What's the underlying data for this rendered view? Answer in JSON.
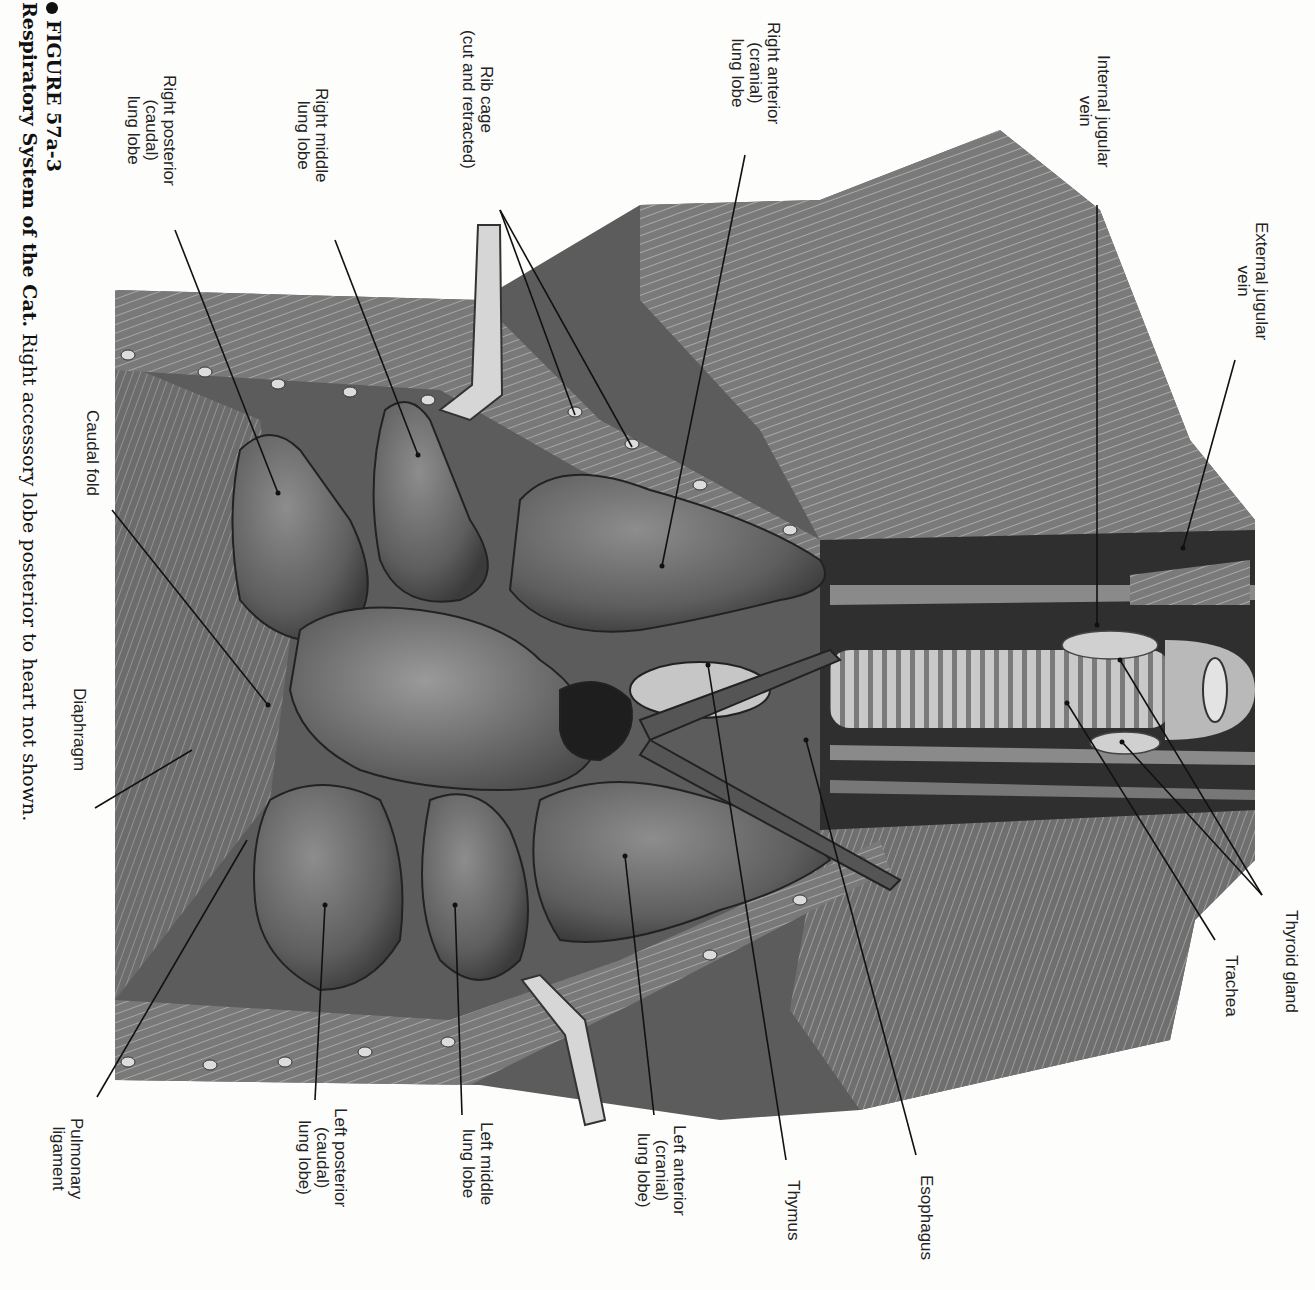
{
  "figure": {
    "number": "FIGURE 57a-3",
    "title": "Respiratory System of the Cat.",
    "caption_text": "Right accessory lobe posterior to heart not shown."
  },
  "labels": {
    "external_jugular_vein": "External jugular\nvein",
    "internal_jugular_vein": "Internal jugular\nvein",
    "right_anterior_lung_lobe": "Right anterior\n(cranial)\nlung lobe",
    "rib_cage": "Rib cage\n(cut and retracted)",
    "right_middle_lung_lobe": "Right middle\nlung lobe",
    "right_posterior_lung_lobe": "Right posterior\n(caudal)\nlung lobe",
    "caudal_fold": "Caudal fold",
    "diaphragm": "Diaphragm",
    "thyroid_gland": "Thyroid gland",
    "trachea": "Trachea",
    "esophagus": "Esophagus",
    "thymus": "Thymus",
    "left_anterior_lung_lobe": "Left anterior\n(cranial)\nlung lobe)",
    "left_middle_lung_lobe": "Left middle\nlung lobe",
    "left_posterior_lung_lobe": "Left posterior\n(caudal)\nlung lobe)",
    "pulmonary_ligament": "Pulmonary\nligament"
  },
  "colors": {
    "paper": "#fdfdfc",
    "tissue_dark": "#3a3a3a",
    "tissue_mid": "#6e6e6e",
    "tissue_light": "#a8a8a8",
    "highlight": "#d8d8d8",
    "leader_line": "#111111"
  }
}
